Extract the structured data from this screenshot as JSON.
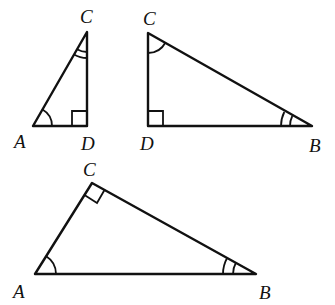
{
  "figure": {
    "triangles": [
      {
        "id": "triangle-ACD",
        "vertices": {
          "A": {
            "label": "A",
            "x": 33,
            "y": 126,
            "label_x": 14,
            "label_y": 148
          },
          "C": {
            "label": "C",
            "x": 87,
            "y": 32,
            "label_x": 80,
            "label_y": 23
          },
          "D": {
            "label": "D",
            "x": 87,
            "y": 126,
            "label_x": 81,
            "label_y": 150
          }
        },
        "right_angle_at": "D",
        "angle_marks": {
          "A": "single arc",
          "C": "double arc"
        }
      },
      {
        "id": "triangle-CDB",
        "vertices": {
          "C": {
            "label": "C",
            "x": 148,
            "y": 33,
            "label_x": 143,
            "label_y": 25
          },
          "D": {
            "label": "D",
            "x": 148,
            "y": 126,
            "label_x": 140,
            "label_y": 150
          },
          "B": {
            "label": "B",
            "x": 312,
            "y": 126,
            "label_x": 309,
            "label_y": 152
          }
        },
        "right_angle_at": "D",
        "angle_marks": {
          "C": "single arc",
          "B": "double arc"
        }
      },
      {
        "id": "triangle-ACB",
        "vertices": {
          "A": {
            "label": "A",
            "x": 35,
            "y": 274,
            "label_x": 13,
            "label_y": 298
          },
          "C": {
            "label": "C",
            "x": 92,
            "y": 183,
            "label_x": 83,
            "label_y": 176
          },
          "B": {
            "label": "B",
            "x": 256,
            "y": 274,
            "label_x": 259,
            "label_y": 299
          }
        },
        "right_angle_at": "C",
        "angle_marks": {
          "A": "single arc",
          "B": "double arc"
        }
      }
    ]
  }
}
